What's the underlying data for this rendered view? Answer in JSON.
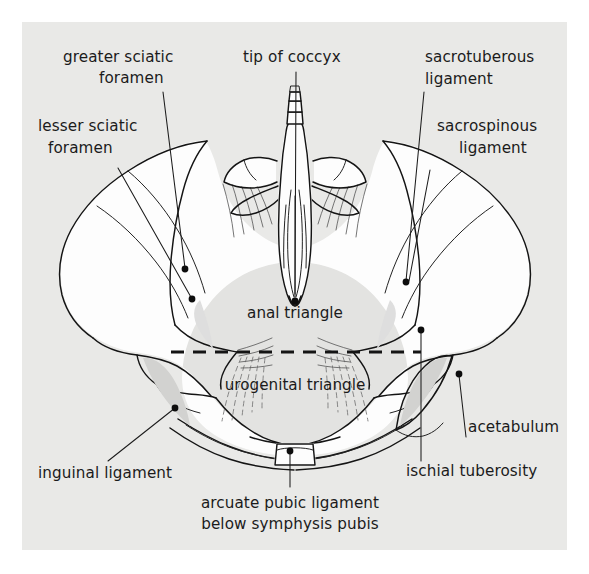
{
  "figure": {
    "panel_background": "#e9e9e7",
    "page_background": "#ffffff",
    "ink_color": "#141414"
  },
  "labels": {
    "greater_sciatic_foramen": {
      "line1": "greater sciatic",
      "line2": "foramen"
    },
    "lesser_sciatic_foramen": {
      "line1": "lesser sciatic",
      "line2": "foramen"
    },
    "tip_of_coccyx": {
      "line1": "tip of coccyx"
    },
    "sacrotuberous_ligament": {
      "line1": "sacrotuberous",
      "line2": "ligament"
    },
    "sacrospinous_ligament": {
      "line1": "sacrospinous",
      "line2": "ligament"
    },
    "acetabulum": {
      "line1": "acetabulum"
    },
    "ischial_tuberosity": {
      "line1": "ischial tuberosity"
    },
    "inguinal_ligament": {
      "line1": "inguinal ligament"
    },
    "arcuate_pubic_ligament": {
      "line1": "arcuate pubic ligament",
      "line2": "below symphysis pubis"
    },
    "anal_triangle": {
      "line1": "anal triangle"
    },
    "urogenital_triangle": {
      "line1": "urogenital triangle"
    }
  }
}
